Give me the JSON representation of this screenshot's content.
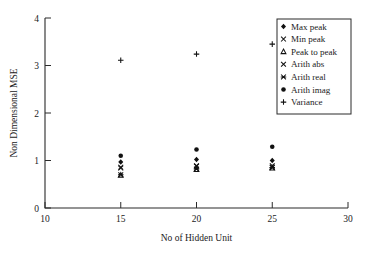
{
  "chart_data": {
    "type": "scatter",
    "title": "",
    "xlabel": "No of Hidden Unit",
    "ylabel": "Non Dimensional MSE",
    "xlim": [
      10,
      30
    ],
    "ylim": [
      0,
      4
    ],
    "xticks": [
      10,
      15,
      20,
      25,
      30
    ],
    "yticks": [
      0,
      1,
      2,
      3,
      4
    ],
    "xtick_labels": [
      "10",
      "15",
      "20",
      "25",
      "30"
    ],
    "ytick_labels": [
      "0",
      "1",
      "2",
      "3",
      "4"
    ],
    "grid": false,
    "legend_position": "top-right",
    "x": [
      15,
      20,
      25
    ],
    "series": [
      {
        "name": "Max peak",
        "marker": "filled-diamond",
        "values": [
          0.97,
          1.02,
          1.0
        ]
      },
      {
        "name": "Min peak",
        "marker": "cross-x",
        "values": [
          0.84,
          0.88,
          0.86
        ]
      },
      {
        "name": "Peak to peak",
        "marker": "open-triangle",
        "values": [
          0.69,
          0.81,
          0.84
        ]
      },
      {
        "name": "Arith abs",
        "marker": "cross-x",
        "values": [
          0.86,
          0.89,
          0.89
        ]
      },
      {
        "name": "Arith real",
        "marker": "asterisk-x",
        "values": [
          0.7,
          0.82,
          0.85
        ]
      },
      {
        "name": "Arith imag",
        "marker": "filled-circle",
        "values": [
          1.1,
          1.23,
          1.29
        ]
      },
      {
        "name": "Variance",
        "marker": "plus",
        "values": [
          3.11,
          3.24,
          3.45
        ]
      }
    ]
  },
  "legend": {
    "items": [
      {
        "label": "Max peak",
        "marker": "filled-diamond"
      },
      {
        "label": "Min peak",
        "marker": "cross-x"
      },
      {
        "label": "Peak to peak",
        "marker": "open-triangle"
      },
      {
        "label": "Arith abs",
        "marker": "cross-x"
      },
      {
        "label": "Arith real",
        "marker": "asterisk-x"
      },
      {
        "label": "Arith imag",
        "marker": "filled-circle"
      },
      {
        "label": "Variance",
        "marker": "plus"
      }
    ]
  },
  "colors": {
    "marker": "#111111",
    "axis": "#2b2b2b",
    "background": "#ffffff"
  }
}
